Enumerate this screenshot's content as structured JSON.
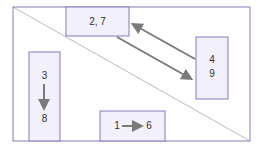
{
  "diagram": {
    "frame_color": "#8878b8",
    "box_fill": "#f2f0fa",
    "arrow_color": "#7a7a7a",
    "boxes": [
      {
        "id": "top",
        "label": "2, 7"
      },
      {
        "id": "right",
        "label_top": "4",
        "label_bottom": "9"
      },
      {
        "id": "left",
        "label_top": "3",
        "label_bottom": "8"
      },
      {
        "id": "bottom",
        "label_left": "1",
        "label_right": "6"
      }
    ]
  }
}
